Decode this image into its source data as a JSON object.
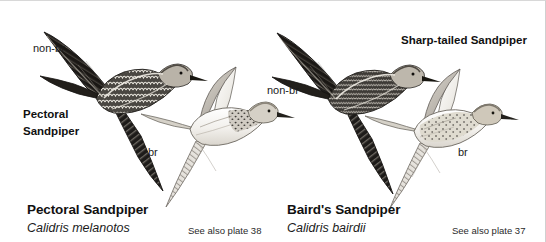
{
  "plate": {
    "background_color": "#ffffff",
    "ink_color": "#1b1b1b",
    "annotations": {
      "nonbr_left": "non-br",
      "species_left_line1": "Pectoral",
      "species_left_line2": "Sandpiper",
      "br_left": "br",
      "nonbr_right": "non-br",
      "sharptailed": "Sharp-tailed Sandpiper",
      "br_right": "br"
    },
    "captions": [
      {
        "common_name": "Pectoral Sandpiper",
        "scientific_name": "Calidris melanotos",
        "plate_reference": "See also plate 38"
      },
      {
        "common_name": "Baird's Sandpiper",
        "scientific_name": "Calidris bairdii",
        "plate_reference": "See also plate 37"
      }
    ],
    "figures": [
      {
        "id": "pectoral-nonbreeding-upperside",
        "plumage": "non-br",
        "view": "upperside",
        "tone": "dark"
      },
      {
        "id": "pectoral-breeding-underside",
        "plumage": "br",
        "view": "underside",
        "tone": "pale"
      },
      {
        "id": "bairds-nonbreeding-upperside",
        "plumage": "non-br",
        "view": "upperside",
        "tone": "dark"
      },
      {
        "id": "sharptailed-breeding-upperside",
        "plumage": "br",
        "view": "upperside",
        "tone": "pale-spotted"
      }
    ]
  }
}
